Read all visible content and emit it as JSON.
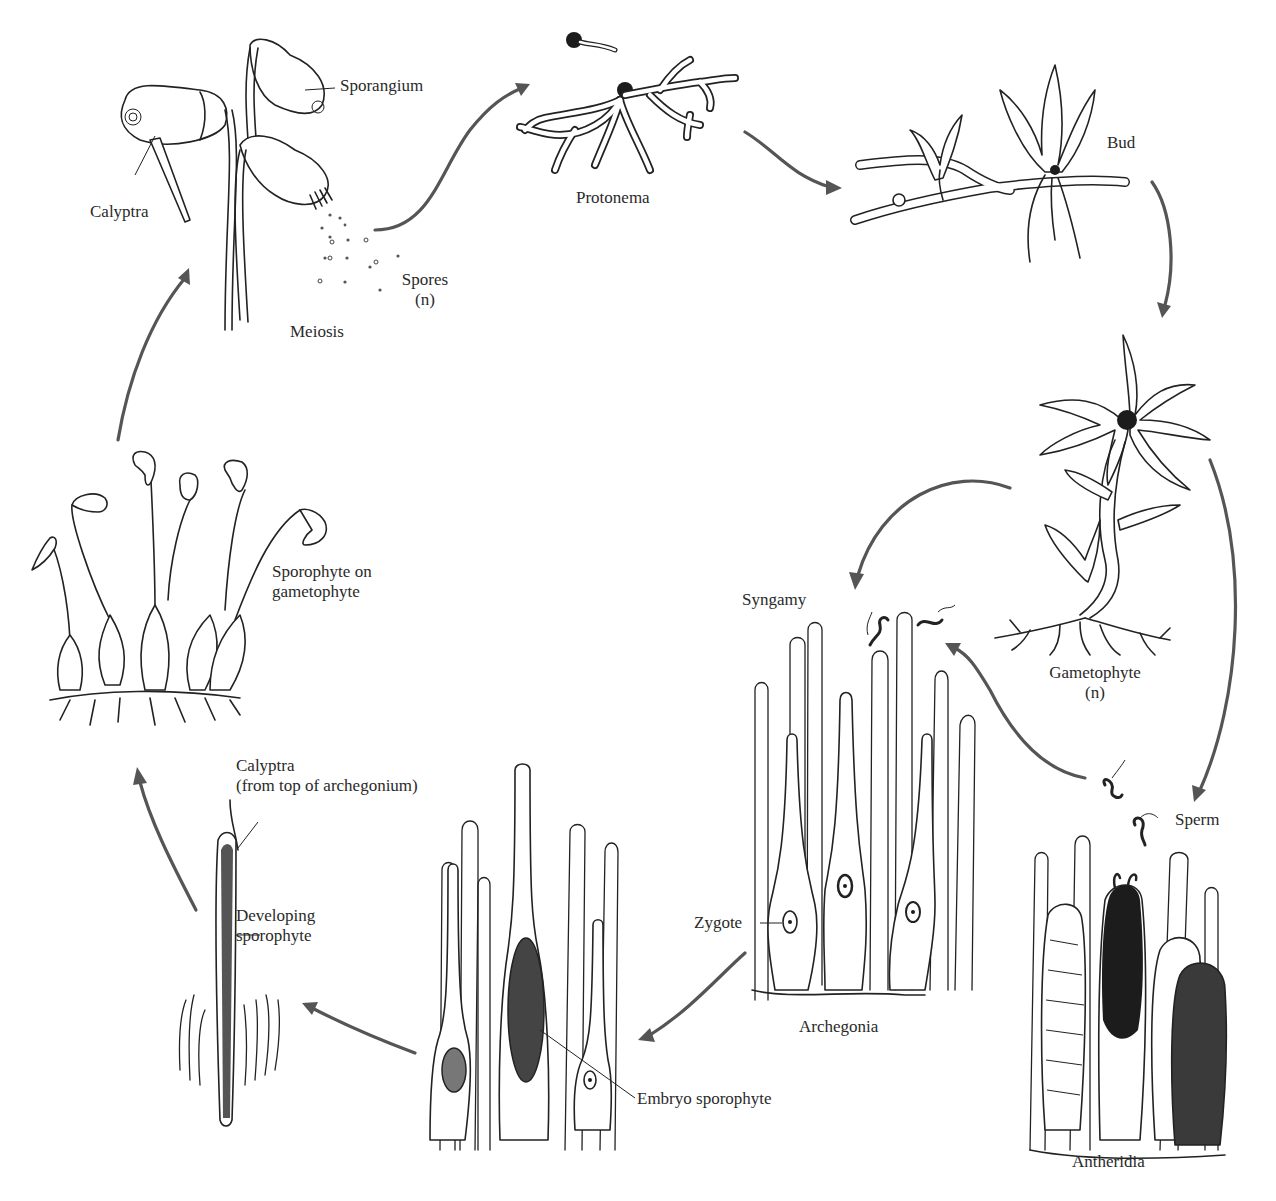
{
  "diagram": {
    "arrow_color": "#555555",
    "line_color": "#222222",
    "background": "#ffffff",
    "stages": [
      {
        "id": "sporophyte-capsules",
        "labels": [
          "Sporangium",
          "Calyptra",
          "Spores\n(n)",
          "Meiosis"
        ]
      },
      {
        "id": "protonema",
        "labels": [
          "Protonema"
        ]
      },
      {
        "id": "bud",
        "labels": [
          "Bud"
        ]
      },
      {
        "id": "gametophyte",
        "labels": [
          "Gametophyte",
          "(n)"
        ]
      },
      {
        "id": "antheridia",
        "labels": [
          "Sperm",
          "Antheridia"
        ]
      },
      {
        "id": "archegonia",
        "labels": [
          "Syngamy",
          "Zygote",
          "Archegonia"
        ]
      },
      {
        "id": "embryo",
        "labels": [
          "Embryo sporophyte"
        ]
      },
      {
        "id": "developing-sporophyte",
        "labels": [
          "Calyptra",
          "(from top of archegonium)",
          "Developing",
          "sporophyte"
        ]
      },
      {
        "id": "sporophyte-on-gametophyte",
        "labels": [
          "Sporophyte on",
          "gametophyte"
        ]
      }
    ]
  },
  "labels": {
    "sporangium": "Sporangium",
    "calyptra_top": "Calyptra",
    "spores_line1": "Spores",
    "spores_line2": "(n)",
    "meiosis": "Meiosis",
    "protonema": "Protonema",
    "bud": "Bud",
    "gametophyte_line1": "Gametophyte",
    "gametophyte_line2": "(n)",
    "syngamy": "Syngamy",
    "sperm": "Sperm",
    "zygote": "Zygote",
    "archegonia": "Archegonia",
    "antheridia": "Antheridia",
    "embryo_sporophyte": "Embryo sporophyte",
    "calyptra_bottom_line1": "Calyptra",
    "calyptra_bottom_line2": "(from top of archegonium)",
    "developing_line1": "Developing",
    "developing_line2": "sporophyte",
    "sporophyte_on_line1": "Sporophyte on",
    "sporophyte_on_line2": "gametophyte"
  }
}
